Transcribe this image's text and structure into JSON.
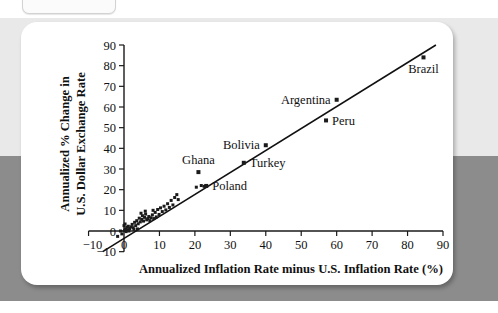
{
  "window": {
    "tab_label": ""
  },
  "chart_data": {
    "type": "scatter",
    "title": "",
    "xlabel": "Annualized Inflation Rate minus U.S. Inflation Rate (%)",
    "ylabel": "Annualized % Change in U.S. Dollar Exchange Rate",
    "ylabel_line1": "Annualized % Change in",
    "ylabel_line2": "U.S. Dollar Exchange Rate",
    "xlim": [
      -10,
      90
    ],
    "ylim": [
      -10,
      90
    ],
    "xticks": [
      -10,
      0,
      10,
      20,
      30,
      40,
      50,
      60,
      70,
      80,
      90
    ],
    "xtick_labels": [
      "−10",
      "0",
      "10",
      "20",
      "30",
      "40",
      "50",
      "60",
      "70",
      "80",
      "90"
    ],
    "yticks": [
      -10,
      0,
      10,
      20,
      30,
      40,
      50,
      60,
      70,
      80,
      90
    ],
    "ytick_labels": [
      "−10",
      "0",
      "10",
      "20",
      "30",
      "40",
      "50",
      "60",
      "70",
      "80",
      "90"
    ],
    "grid": false,
    "legend": "none",
    "marker": "square",
    "marker_color": "#1b1b1b",
    "line_color": "#111111",
    "fit_line": {
      "label": "regression line",
      "x_start": -6,
      "y_start": -10,
      "x_end": 88,
      "y_end": 90
    },
    "labeled_points": [
      {
        "name": "Brazil",
        "x": 84.5,
        "y": 84.0,
        "label": "Brazil",
        "label_side": "below"
      },
      {
        "name": "Argentina",
        "x": 60.0,
        "y": 63.5,
        "label": "Argentina",
        "label_side": "left"
      },
      {
        "name": "Peru",
        "x": 57.0,
        "y": 53.5,
        "label": "Peru",
        "label_side": "right"
      },
      {
        "name": "Bolivia",
        "x": 40.0,
        "y": 41.5,
        "label": "Bolivia",
        "label_side": "left"
      },
      {
        "name": "Turkey",
        "x": 33.8,
        "y": 33.0,
        "label": "Turkey",
        "label_side": "right"
      },
      {
        "name": "Ghana",
        "x": 21.0,
        "y": 28.5,
        "label": "Ghana",
        "label_side": "above"
      },
      {
        "name": "Poland",
        "x": 23.2,
        "y": 21.8,
        "label": "Poland",
        "label_side": "right"
      }
    ],
    "unlabeled_points": [
      {
        "x": 0.2,
        "y": 0.3
      },
      {
        "x": 0.4,
        "y": 1.0
      },
      {
        "x": 0.6,
        "y": -0.3
      },
      {
        "x": 0.8,
        "y": 1.8
      },
      {
        "x": 1.0,
        "y": 0.6
      },
      {
        "x": 1.2,
        "y": 2.3
      },
      {
        "x": 0.3,
        "y": 3.4
      },
      {
        "x": 1.6,
        "y": 1.2
      },
      {
        "x": 2.0,
        "y": 2.0
      },
      {
        "x": 2.3,
        "y": 3.2
      },
      {
        "x": 2.6,
        "y": 1.6
      },
      {
        "x": 3.0,
        "y": 4.2
      },
      {
        "x": 3.3,
        "y": 2.6
      },
      {
        "x": 3.6,
        "y": 5.0
      },
      {
        "x": 4.0,
        "y": 3.5
      },
      {
        "x": 4.3,
        "y": 6.2
      },
      {
        "x": 4.6,
        "y": 4.4
      },
      {
        "x": 5.0,
        "y": 5.6
      },
      {
        "x": 5.2,
        "y": 7.4
      },
      {
        "x": 5.5,
        "y": 4.8
      },
      {
        "x": 5.8,
        "y": 6.6
      },
      {
        "x": 6.1,
        "y": 8.2
      },
      {
        "x": 6.4,
        "y": 5.4
      },
      {
        "x": 6.7,
        "y": 6.0
      },
      {
        "x": 7.0,
        "y": 7.0
      },
      {
        "x": 7.3,
        "y": 5.0
      },
      {
        "x": 7.6,
        "y": 6.4
      },
      {
        "x": 8.0,
        "y": 7.8
      },
      {
        "x": 8.4,
        "y": 6.0
      },
      {
        "x": 8.8,
        "y": 9.0
      },
      {
        "x": 9.1,
        "y": 6.8
      },
      {
        "x": 9.5,
        "y": 10.4
      },
      {
        "x": 9.9,
        "y": 8.0
      },
      {
        "x": 10.3,
        "y": 11.2
      },
      {
        "x": 10.8,
        "y": 9.4
      },
      {
        "x": 11.3,
        "y": 12.0
      },
      {
        "x": 11.8,
        "y": 10.2
      },
      {
        "x": 12.3,
        "y": 13.2
      },
      {
        "x": 12.8,
        "y": 11.4
      },
      {
        "x": 13.3,
        "y": 14.8
      },
      {
        "x": 13.8,
        "y": 12.6
      },
      {
        "x": 14.3,
        "y": 16.2
      },
      {
        "x": 14.9,
        "y": 17.6
      },
      {
        "x": 15.3,
        "y": 15.2
      },
      {
        "x": 20.4,
        "y": 21.2
      },
      {
        "x": 21.8,
        "y": 22.0
      },
      {
        "x": 22.6,
        "y": 21.6
      },
      {
        "x": -1.0,
        "y": 0.0
      },
      {
        "x": -0.6,
        "y": -1.4
      },
      {
        "x": -1.8,
        "y": -2.6
      },
      {
        "x": 0.0,
        "y": 2.6
      },
      {
        "x": 1.4,
        "y": 0.0
      },
      {
        "x": 2.8,
        "y": 0.8
      },
      {
        "x": 6.0,
        "y": 9.6
      },
      {
        "x": 4.8,
        "y": 8.6
      },
      {
        "x": 3.8,
        "y": 1.0
      },
      {
        "x": 8.2,
        "y": 10.0
      }
    ]
  }
}
